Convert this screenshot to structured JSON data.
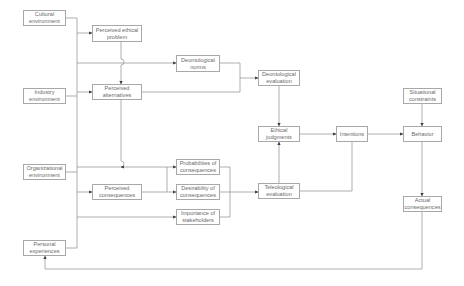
{
  "diagram": {
    "colors": {
      "line": "#9a9a9a",
      "box_border": "#a8a8a8",
      "text": "#6a6a6a",
      "background": "#ffffff"
    },
    "nodes": {
      "cultural_env": "Cultural\nenvironment",
      "industry_env": "Industry\nenvironment",
      "organizational_env": "Organizational\nenvironment",
      "personal_exp": "Personal\nexperiences",
      "perceived_problem": "Perceived ethical\nproblem",
      "perceived_alternatives": "Perceived\nalternatives",
      "perceived_consequences": "Perceived\nconsequences",
      "deontological_norms": "Deontological\nnorms",
      "probabilities": "Probabilities of\nconsequences",
      "desirability": "Desirability of\nconsequences",
      "importance": "Importance of\nstakeholders",
      "deontological_eval": "Deontological\nevaluation",
      "ethical_judgments": "Ethical\njudgments",
      "teleological_eval": "Teleological\nevaluation",
      "intentions": "Intentions",
      "situational_constraints": "Situational\nconstraints",
      "behavior": "Behavior",
      "actual_consequences": "Actual\nconsequences"
    },
    "edges": [
      [
        "environment-bus",
        "perceived_problem"
      ],
      [
        "environment-bus",
        "deontological_norms"
      ],
      [
        "environment-bus",
        "perceived_alternatives"
      ],
      [
        "environment-bus",
        "probabilities"
      ],
      [
        "environment-bus",
        "perceived_consequences"
      ],
      [
        "environment-bus",
        "importance"
      ],
      [
        "perceived_problem",
        "perceived_alternatives"
      ],
      [
        "perceived_alternatives",
        "deontological_eval"
      ],
      [
        "perceived_alternatives",
        "probabilities"
      ],
      [
        "deontological_norms",
        "deontological_eval"
      ],
      [
        "perceived_consequences",
        "probabilities"
      ],
      [
        "perceived_consequences",
        "desirability"
      ],
      [
        "probabilities",
        "teleological_eval"
      ],
      [
        "desirability",
        "teleological_eval"
      ],
      [
        "importance",
        "teleological_eval"
      ],
      [
        "deontological_eval",
        "ethical_judgments"
      ],
      [
        "teleological_eval",
        "ethical_judgments"
      ],
      [
        "teleological_eval",
        "intentions"
      ],
      [
        "ethical_judgments",
        "intentions"
      ],
      [
        "intentions",
        "behavior"
      ],
      [
        "situational_constraints",
        "behavior"
      ],
      [
        "behavior",
        "actual_consequences"
      ],
      [
        "actual_consequences",
        "personal_exp"
      ]
    ]
  }
}
